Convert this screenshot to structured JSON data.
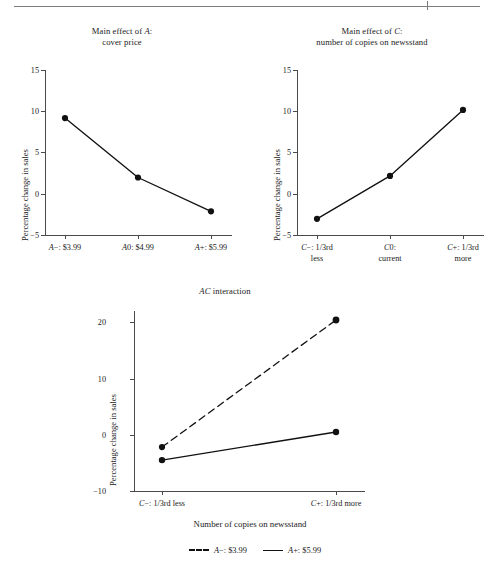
{
  "figure": {
    "background": "#ffffff",
    "ink": "#111111",
    "axis_color": "#4a4a4a",
    "rule_color": "#7d7d7d"
  },
  "chart_data": [
    {
      "id": "main-effect-a",
      "type": "line",
      "title_line1": "Main effect of A:",
      "title_line2": "cover price",
      "title_italic_token": "A",
      "ylabel": "Percentage change in sales",
      "xlabel": "",
      "categories": [
        "A−: $3.99",
        "A0: $4.99",
        "A+: $5.99"
      ],
      "categories_line2": [
        "",
        "",
        ""
      ],
      "values": [
        9.2,
        2.0,
        -2.1
      ],
      "ylim": [
        -5,
        15
      ],
      "yticks": [
        -5,
        0,
        5,
        10,
        15
      ],
      "ytick_labels": [
        "−5",
        "0",
        "5",
        "10",
        "15"
      ],
      "grid": false,
      "legend": "none",
      "marker": "filled-circle",
      "linestyle": "solid"
    },
    {
      "id": "main-effect-c",
      "type": "line",
      "title_line1": "Main effect of C:",
      "title_line2": "number of copies on newsstand",
      "title_italic_token": "C",
      "ylabel": "Percentage change in sales",
      "xlabel": "",
      "categories": [
        "C−: 1/3rd",
        "C0:",
        "C+: 1/3rd"
      ],
      "categories_line2": [
        "less",
        "current",
        "more"
      ],
      "values": [
        -3.0,
        2.2,
        10.2
      ],
      "ylim": [
        -5,
        15
      ],
      "yticks": [
        -5,
        0,
        5,
        10,
        15
      ],
      "ytick_labels": [
        "−5",
        "0",
        "5",
        "10",
        "15"
      ],
      "grid": false,
      "legend": "none",
      "marker": "filled-circle",
      "linestyle": "solid"
    },
    {
      "id": "ac-interaction",
      "type": "line",
      "title_line1": "AC interaction",
      "title_line2": "",
      "title_italic_token": "AC",
      "ylabel": "Percentage change in sales",
      "xlabel": "Number of copies on newsstand",
      "categories": [
        "C−: 1/3rd less",
        "C+: 1/3rd more"
      ],
      "ylim": [
        -10,
        22
      ],
      "yticks": [
        -10,
        0,
        10,
        20
      ],
      "ytick_labels": [
        "−10",
        "0",
        "10",
        "20"
      ],
      "grid": false,
      "legend": "bottom-center",
      "series": [
        {
          "name": "A−: $3.99",
          "values": [
            -2.2,
            20.4
          ],
          "linestyle": "dashed",
          "marker": "filled-circle"
        },
        {
          "name": "A+: $5.99",
          "values": [
            -4.5,
            0.5
          ],
          "linestyle": "solid",
          "marker": "filled-circle"
        }
      ]
    }
  ],
  "legend": {
    "items": [
      {
        "label_prefix": "A",
        "label_rest": "−: $3.99",
        "style": "dashed"
      },
      {
        "label_prefix": "A",
        "label_rest": "+: $5.99",
        "style": "solid"
      }
    ]
  }
}
